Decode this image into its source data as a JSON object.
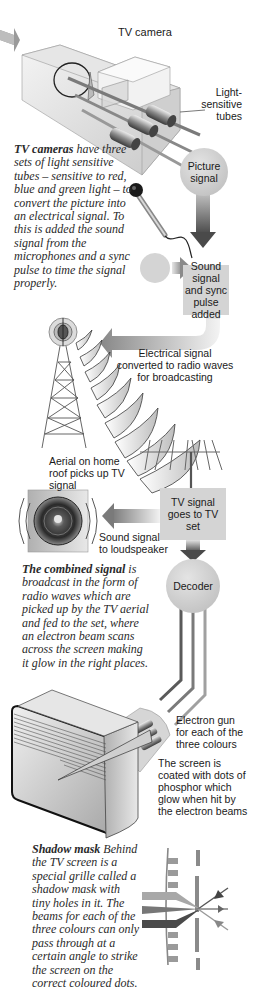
{
  "camera": {
    "title": "TV camera",
    "tubes_label": "Light-sensitive tubes",
    "picture_signal": "Picture signal",
    "caption_heading": "TV cameras",
    "caption_body": "have three sets of light sensitive tubes – sensitive to red, blue and green light – to convert the picture into an electrical signal. To this is added the sound signal from the microphones and a sync pulse to time the signal properly."
  },
  "mixing": {
    "box_label": "Sound signal and sync pulse added"
  },
  "broadcast": {
    "label": "Electrical signal converted to radio waves for broadcasting"
  },
  "aerial": {
    "label": "Aerial on home roof picks up TV signal"
  },
  "tv_set": {
    "box_label": "TV signal goes to TV set",
    "speaker_label": "Sound signal to loudspeaker",
    "decoder_label": "Decoder",
    "caption_heading": "The combined signal",
    "caption_body": "is broadcast in the form of radio waves which are picked up by the TV aerial and fed to the set, where an electron beam scans across the screen making it glow in the right places."
  },
  "screen": {
    "gun_label": "Electron gun for each of the three colours",
    "phosphor_label": "The screen is coated with dots of phosphor which glow when hit by the electron beams"
  },
  "shadow_mask": {
    "caption_heading": "Shadow mask",
    "caption_body": "Behind the TV screen is a special grille called a shadow mask with tiny holes in it. The beams for each of the three colours can only pass through at a certain angle to strike the screen on the correct coloured dots."
  },
  "colors": {
    "box_fill": "#d4d4d4",
    "arrow_dark": "#5a5a5a",
    "text": "#1a1a1a"
  }
}
